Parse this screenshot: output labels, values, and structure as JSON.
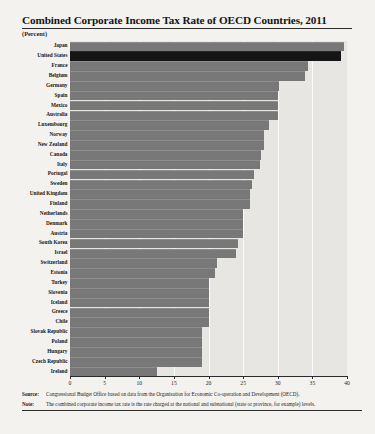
{
  "title": "Combined Corporate Income Tax Rate of OECD Countries, 2011",
  "unit_label": "(Percent)",
  "footnotes": {
    "source_label": "Source:",
    "source_text": "Congressional Budget Office based on data from the Organisation for Economic Co-operation and Development (OECD).",
    "note_label": "Note:",
    "note_text": "The combined corporate income tax rate is the rate charged at the national and subnational (state or province, for example) levels."
  },
  "chart_data": {
    "type": "bar",
    "orientation": "horizontal",
    "title": "Combined Corporate Income Tax Rate of OECD Countries, 2011",
    "xlabel": "(Percent)",
    "ylabel": "",
    "xlim": [
      0,
      40
    ],
    "xticks": [
      0,
      5,
      10,
      15,
      20,
      25,
      30,
      35,
      40
    ],
    "xticklabels": [
      "0",
      "5",
      "10",
      "15",
      "20",
      "25",
      "30",
      "35",
      "40"
    ],
    "grid": true,
    "legend": false,
    "highlight_category": "United States",
    "colors": {
      "bar": "#787878",
      "highlight_bar": "#151515",
      "plot_background": "#e8e6e2",
      "gridline": "#fbfaf8",
      "page_background": "#f3f2ef"
    },
    "categories": [
      "Japan",
      "United States",
      "France",
      "Belgium",
      "Germany",
      "Spain",
      "Mexico",
      "Australia",
      "Luxembourg",
      "Norway",
      "New Zealand",
      "Canada",
      "Italy",
      "Portugal",
      "Sweden",
      "United Kingdom",
      "Finland",
      "Netherlands",
      "Denmark",
      "Austria",
      "South Korea",
      "Israel",
      "Switzerland",
      "Estonia",
      "Turkey",
      "Slovenia",
      "Iceland",
      "Greece",
      "Chile",
      "Slovak Republic",
      "Poland",
      "Hungary",
      "Czech Republic",
      "Ireland"
    ],
    "values": [
      39.5,
      39.2,
      34.4,
      34.0,
      30.2,
      30.0,
      30.0,
      30.0,
      28.8,
      28.0,
      28.0,
      27.6,
      27.5,
      26.5,
      26.3,
      26.0,
      26.0,
      25.0,
      25.0,
      25.0,
      24.2,
      24.0,
      21.2,
      21.0,
      20.0,
      20.0,
      20.0,
      20.0,
      20.0,
      19.0,
      19.0,
      19.0,
      19.0,
      12.5
    ]
  }
}
